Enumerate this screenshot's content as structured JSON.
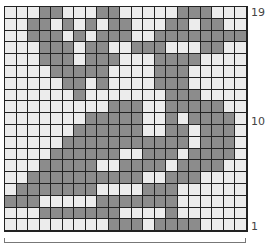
{
  "chart": {
    "columns": 21,
    "rows": 19,
    "colors": {
      "light": "#ececec",
      "dark": "#8c8c8c",
      "grid": "#222222"
    },
    "row_labels": [
      {
        "label": "19",
        "row": 19
      },
      {
        "label": "10",
        "row": 10
      },
      {
        "label": "1",
        "row": 1
      }
    ],
    "grid_top_to_bottom": [
      "LLLDDLLLDDLLLLLDDDLLL",
      "LLDDLDLDLDDLLLDDLDDLL",
      "LLDDDLDLDDDLLDDDDDDDD",
      "LLLDDDLDDLLDDDLLLDDLL",
      "LLLDDDLDDDLLLDDDDLLLL",
      "LLLLDDDDDLLLLDDDLLLLL",
      "LLLLLDDLDLLLLDDDLLLLL",
      "LLLLLLDLLLLLLLDDDLLLL",
      "LLLLLLLLLDDDLLDDDDDLL",
      "LLLLLLLDDDDDLLDLDDDDL",
      "LLLLLLDDDDDDLLDDLDDDL",
      "LLLLLDDDDDDDDDDDLDDDL",
      "LLLLDDDDDDLLDDDLDDDDL",
      "LLLDDDDDLLDDDDLDDDDLL",
      "LLDDDDDDDDDDLLDDDLLLL",
      "LDDDDDDDLLLLDDDLLLLLL",
      "DDDLLLLLDDDDDDDLLLLLL",
      "LLLDDDDDDDLLLLDLLLLLL",
      "LLLLLLLLLDDDLDDDDLLLL"
    ]
  }
}
